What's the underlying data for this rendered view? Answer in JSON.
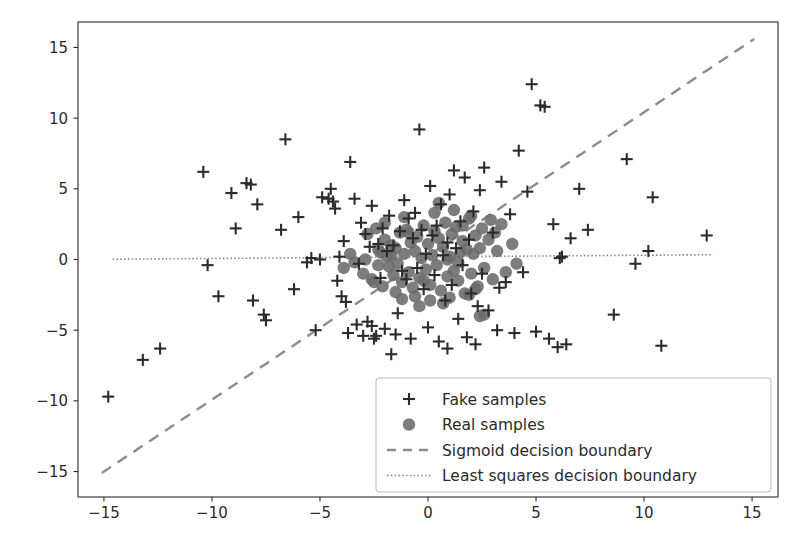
{
  "chart_data": {
    "type": "scatter",
    "title": "",
    "xlabel": "",
    "ylabel": "",
    "xlim": [
      -16.2,
      16.2
    ],
    "ylim": [
      -16.8,
      16.8
    ],
    "xticks": [
      -15,
      -10,
      -5,
      0,
      5,
      10,
      15
    ],
    "yticks": [
      -15,
      -10,
      -5,
      0,
      5,
      10,
      15
    ],
    "xticklabels": [
      "−15",
      "−10",
      "−5",
      "0",
      "5",
      "10",
      "15"
    ],
    "yticklabels": [
      "−15",
      "−10",
      "−5",
      "0",
      "5",
      "10",
      "15"
    ],
    "grid": false,
    "legend_position": "lower right",
    "marker_color": "#4a4a4a",
    "real_marker_color": "#6b6b6b",
    "line_color": "#8c8c8c",
    "series": [
      {
        "name": "Fake samples",
        "marker": "+",
        "color": "#2b2b2b",
        "points": [
          [
            -14.8,
            -9.7
          ],
          [
            -13.2,
            -7.1
          ],
          [
            -12.4,
            -6.3
          ],
          [
            -10.4,
            6.2
          ],
          [
            -10.2,
            -0.4
          ],
          [
            -9.7,
            -2.6
          ],
          [
            -9.1,
            4.7
          ],
          [
            -8.9,
            2.2
          ],
          [
            -8.4,
            5.4
          ],
          [
            -8.2,
            5.3
          ],
          [
            -8.1,
            -2.9
          ],
          [
            -7.9,
            3.9
          ],
          [
            -7.6,
            -3.9
          ],
          [
            -7.5,
            -4.3
          ],
          [
            -6.8,
            2.1
          ],
          [
            -6.6,
            8.5
          ],
          [
            -6.2,
            -2.1
          ],
          [
            -6.0,
            3.0
          ],
          [
            -5.6,
            -0.2
          ],
          [
            -5.4,
            0.1
          ],
          [
            -5.2,
            -5.0
          ],
          [
            -4.9,
            4.4
          ],
          [
            -4.6,
            4.3
          ],
          [
            -4.5,
            5.0
          ],
          [
            -4.4,
            4.1
          ],
          [
            -4.3,
            3.6
          ],
          [
            -4.2,
            -1.5
          ],
          [
            -4.1,
            0.2
          ],
          [
            -4.0,
            -2.6
          ],
          [
            -3.9,
            1.3
          ],
          [
            -3.8,
            -3.0
          ],
          [
            -3.7,
            -5.2
          ],
          [
            -3.6,
            6.9
          ],
          [
            -3.4,
            4.3
          ],
          [
            -3.2,
            -0.3
          ],
          [
            -3.1,
            2.6
          ],
          [
            -3.0,
            -5.4
          ],
          [
            -2.9,
            1.8
          ],
          [
            -2.8,
            -4.4
          ],
          [
            -2.7,
            0.9
          ],
          [
            -2.6,
            3.8
          ],
          [
            -2.5,
            -5.6
          ],
          [
            -2.4,
            -5.4
          ],
          [
            -2.3,
            1.1
          ],
          [
            -2.2,
            -1.3
          ],
          [
            -2.1,
            2.2
          ],
          [
            -2.0,
            -4.9
          ],
          [
            -1.9,
            0.6
          ],
          [
            -1.8,
            3.1
          ],
          [
            -1.7,
            -6.7
          ],
          [
            -1.6,
            1.0
          ],
          [
            -1.5,
            -5.3
          ],
          [
            -1.3,
            2.0
          ],
          [
            -1.2,
            -0.8
          ],
          [
            -1.1,
            4.2
          ],
          [
            -1.0,
            -1.4
          ],
          [
            -0.9,
            2.9
          ],
          [
            -0.8,
            -5.6
          ],
          [
            -0.7,
            1.5
          ],
          [
            -0.6,
            3.3
          ],
          [
            -0.5,
            -0.6
          ],
          [
            -0.4,
            9.2
          ],
          [
            -0.3,
            2.1
          ],
          [
            -0.2,
            -2.1
          ],
          [
            -0.1,
            0.4
          ],
          [
            0.0,
            -4.8
          ],
          [
            0.1,
            5.2
          ],
          [
            0.2,
            1.7
          ],
          [
            0.3,
            -1.1
          ],
          [
            0.4,
            2.4
          ],
          [
            0.5,
            -5.8
          ],
          [
            0.6,
            3.9
          ],
          [
            0.7,
            0.3
          ],
          [
            0.8,
            -2.9
          ],
          [
            0.9,
            1.2
          ],
          [
            1.0,
            4.6
          ],
          [
            1.1,
            -1.8
          ],
          [
            1.2,
            6.3
          ],
          [
            1.3,
            0.8
          ],
          [
            1.4,
            -4.2
          ],
          [
            1.5,
            2.7
          ],
          [
            1.6,
            -0.4
          ],
          [
            1.7,
            5.8
          ],
          [
            1.8,
            -5.5
          ],
          [
            1.9,
            1.4
          ],
          [
            2.0,
            -2.4
          ],
          [
            2.1,
            3.4
          ],
          [
            2.2,
            -6.0
          ],
          [
            2.4,
            4.9
          ],
          [
            2.5,
            -1.0
          ],
          [
            2.6,
            6.5
          ],
          [
            2.8,
            -3.6
          ],
          [
            3.0,
            1.9
          ],
          [
            3.2,
            -5.0
          ],
          [
            3.4,
            5.5
          ],
          [
            3.6,
            -1.6
          ],
          [
            3.8,
            3.2
          ],
          [
            4.0,
            -5.2
          ],
          [
            4.2,
            7.7
          ],
          [
            4.4,
            -0.9
          ],
          [
            4.6,
            4.8
          ],
          [
            4.8,
            12.4
          ],
          [
            5.0,
            -5.1
          ],
          [
            5.2,
            10.9
          ],
          [
            5.4,
            10.8
          ],
          [
            5.6,
            -5.6
          ],
          [
            5.8,
            2.5
          ],
          [
            6.0,
            -6.2
          ],
          [
            6.2,
            0.2
          ],
          [
            6.4,
            -6.0
          ],
          [
            6.6,
            1.5
          ],
          [
            7.0,
            5.0
          ],
          [
            7.4,
            2.1
          ],
          [
            8.6,
            -3.9
          ],
          [
            9.2,
            7.1
          ],
          [
            9.6,
            -0.3
          ],
          [
            10.2,
            0.6
          ],
          [
            10.4,
            4.4
          ],
          [
            10.8,
            -6.1
          ],
          [
            12.9,
            1.7
          ],
          [
            -3.3,
            -4.6
          ],
          [
            -2.6,
            -4.7
          ],
          [
            0.9,
            -6.3
          ],
          [
            3.3,
            -2.0
          ],
          [
            -1.4,
            -3.8
          ],
          [
            2.3,
            -3.3
          ],
          [
            -5.0,
            0.0
          ],
          [
            6.1,
            0.1
          ]
        ]
      },
      {
        "name": "Real samples",
        "marker": "o",
        "color": "#6b6b6b",
        "points": [
          [
            -2.9,
            0.0
          ],
          [
            -3.0,
            -1.0
          ],
          [
            -2.6,
            -1.4
          ],
          [
            -2.5,
            -1.6
          ],
          [
            -2.3,
            0.7
          ],
          [
            -2.2,
            0.5
          ],
          [
            -2.1,
            -1.9
          ],
          [
            -2.0,
            1.4
          ],
          [
            -1.9,
            0.2
          ],
          [
            -1.8,
            -0.5
          ],
          [
            -1.7,
            1.0
          ],
          [
            -1.6,
            -1.1
          ],
          [
            -1.5,
            0.8
          ],
          [
            -1.4,
            -0.3
          ],
          [
            -1.3,
            1.9
          ],
          [
            -1.2,
            -1.6
          ],
          [
            -1.1,
            0.4
          ],
          [
            -1.0,
            2.1
          ],
          [
            -0.9,
            -0.9
          ],
          [
            -0.8,
            1.2
          ],
          [
            -0.7,
            -2.0
          ],
          [
            -0.6,
            0.6
          ],
          [
            -0.5,
            1.6
          ],
          [
            -0.4,
            -1.3
          ],
          [
            -0.3,
            0.1
          ],
          [
            -0.2,
            2.4
          ],
          [
            -0.1,
            -0.7
          ],
          [
            0.0,
            1.1
          ],
          [
            0.1,
            -1.8
          ],
          [
            0.2,
            0.3
          ],
          [
            0.3,
            2.0
          ],
          [
            0.4,
            -0.4
          ],
          [
            0.5,
            1.5
          ],
          [
            0.6,
            -2.2
          ],
          [
            0.7,
            0.9
          ],
          [
            0.8,
            2.6
          ],
          [
            0.9,
            -1.2
          ],
          [
            1.0,
            0.2
          ],
          [
            1.1,
            1.8
          ],
          [
            1.2,
            -0.8
          ],
          [
            1.3,
            2.3
          ],
          [
            1.4,
            -1.5
          ],
          [
            1.5,
            0.5
          ],
          [
            1.6,
            1.3
          ],
          [
            1.7,
            -2.4
          ],
          [
            1.8,
            0.7
          ],
          [
            1.9,
            2.9
          ],
          [
            2.0,
            -1.0
          ],
          [
            2.1,
            0.4
          ],
          [
            2.2,
            1.7
          ],
          [
            2.3,
            -1.9
          ],
          [
            2.4,
            0.8
          ],
          [
            2.5,
            2.2
          ],
          [
            2.6,
            -0.6
          ],
          [
            2.8,
            1.4
          ],
          [
            3.0,
            -1.4
          ],
          [
            3.2,
            0.6
          ],
          [
            3.4,
            2.5
          ],
          [
            3.6,
            -0.9
          ],
          [
            3.9,
            1.1
          ],
          [
            -2.8,
            1.8
          ],
          [
            -2.4,
            2.2
          ],
          [
            -1.1,
            3.0
          ],
          [
            0.3,
            3.3
          ],
          [
            1.2,
            3.5
          ],
          [
            2.0,
            3.1
          ],
          [
            2.9,
            2.8
          ],
          [
            -0.6,
            -2.6
          ],
          [
            0.1,
            -2.9
          ],
          [
            1.0,
            -2.7
          ],
          [
            1.9,
            -2.5
          ],
          [
            -1.5,
            -2.3
          ],
          [
            2.6,
            -3.9
          ],
          [
            2.4,
            -4.0
          ],
          [
            -0.4,
            -3.3
          ],
          [
            0.7,
            -3.1
          ],
          [
            -3.4,
            -0.2
          ],
          [
            -3.6,
            0.4
          ],
          [
            -3.9,
            -0.6
          ],
          [
            4.1,
            -0.3
          ],
          [
            -2.0,
            2.6
          ],
          [
            3.1,
            1.9
          ],
          [
            -1.2,
            -2.8
          ],
          [
            0.5,
            4.0
          ],
          [
            1.6,
            2.4
          ],
          [
            -0.9,
            1.9
          ],
          [
            2.2,
            -2.1
          ],
          [
            -2.3,
            -0.4
          ],
          [
            0.9,
            0.0
          ],
          [
            -0.2,
            -1.5
          ],
          [
            1.4,
            -0.2
          ],
          [
            -1.7,
            0.3
          ]
        ]
      }
    ],
    "lines": [
      {
        "name": "Sigmoid decision boundary",
        "style": "dashed",
        "color": "#8c8c8c",
        "x": [
          -15.1,
          15.1
        ],
        "y": [
          -15.1,
          15.6
        ]
      },
      {
        "name": "Least squares decision boundary",
        "style": "dotted",
        "color": "#8c8c8c",
        "x": [
          -14.6,
          13.2
        ],
        "y": [
          0.02,
          0.34
        ]
      }
    ],
    "legend_entries": [
      {
        "label": "Fake samples",
        "kind": "marker",
        "marker": "+",
        "color": "#2b2b2b"
      },
      {
        "label": "Real samples",
        "kind": "marker",
        "marker": "o",
        "color": "#6b6b6b"
      },
      {
        "label": "Sigmoid decision boundary",
        "kind": "line",
        "style": "dashed",
        "color": "#8c8c8c"
      },
      {
        "label": "Least squares decision boundary",
        "kind": "line",
        "style": "dotted",
        "color": "#8c8c8c"
      }
    ]
  }
}
